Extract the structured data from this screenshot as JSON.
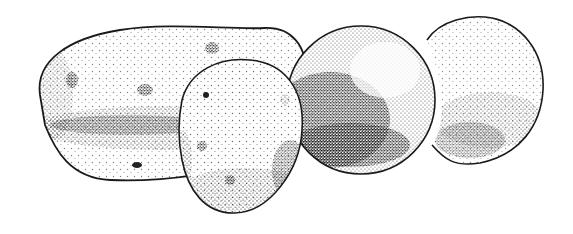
{
  "image": {
    "subject": "Stippled ink illustration of four potatoes",
    "style": "black-and-white pen stippling",
    "background": "#ffffff",
    "ink": "#1a1a1a"
  },
  "objects": [
    {
      "name": "large-oblong-potato",
      "position": "left"
    },
    {
      "name": "small-round-potato-front",
      "position": "center-left"
    },
    {
      "name": "dark-round-potato",
      "position": "center-right"
    },
    {
      "name": "light-round-potato",
      "position": "right"
    }
  ]
}
